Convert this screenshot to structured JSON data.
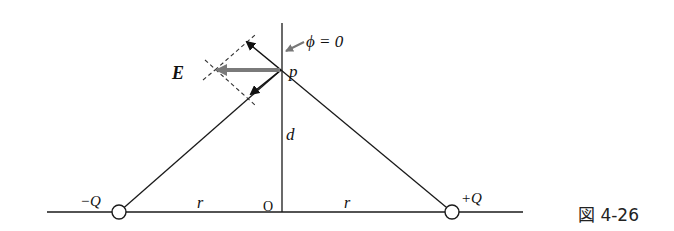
{
  "figure": {
    "caption": "図 4-26",
    "labels": {
      "phi": "ϕ = 0",
      "point": "p",
      "field": "E",
      "distance_d": "d",
      "origin": "O",
      "r_left": "r",
      "r_right": "r",
      "neg_charge": "−Q",
      "pos_charge": "+Q"
    },
    "colors": {
      "line": "#1a1a1a",
      "field_arrow": "#7a7a7a",
      "dashed": "#333333"
    }
  }
}
